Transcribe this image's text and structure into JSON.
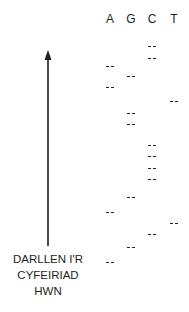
{
  "diagram": {
    "columns": [
      {
        "label": "A",
        "x": 110
      },
      {
        "label": "G",
        "x": 131
      },
      {
        "label": "C",
        "x": 152
      },
      {
        "label": "T",
        "x": 174
      }
    ],
    "bands": {
      "A": [
        66,
        87,
        212,
        262
      ],
      "G": [
        76,
        113,
        124,
        197,
        247
      ],
      "C": [
        46,
        58,
        145,
        156,
        168,
        179,
        234
      ],
      "T": [
        101,
        223
      ]
    },
    "arrow": {
      "x": 48,
      "top": 50,
      "bottom": 246,
      "direction": "up"
    },
    "caption": {
      "lines": [
        "DARLLEN I'R",
        "CYFEIRIAD",
        "HWN"
      ]
    },
    "colors": {
      "ink": "#231f20",
      "background": "#ffffff"
    }
  }
}
